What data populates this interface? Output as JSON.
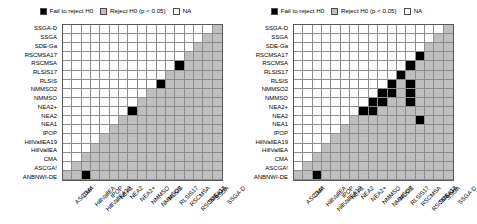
{
  "chart_data": {
    "type": "heatmap",
    "title": "",
    "xlabel": "",
    "ylabel": "",
    "legend_position": "top",
    "grid": true,
    "categories_x": [
      "ASCGA!",
      "CMA",
      "HillVallEA",
      "HillVallEA19",
      "IPOP",
      "NEA1",
      "NEA2",
      "NEA2+",
      "NMMSO",
      "NMMSO2",
      "RLSIS",
      "RLSIS17",
      "RSCMSA",
      "RSCMSA17",
      "SDE-Ga",
      "SSGA",
      "SSGA-D"
    ],
    "categories_y": [
      "SSGA-D",
      "SSGA",
      "SDE-Ga",
      "RSCMSA17",
      "RSCMSA",
      "RLSIS17",
      "RLSIS",
      "NMMSO2",
      "NMMSO",
      "NEA2+",
      "NEA2",
      "NEA1",
      "IPOP",
      "HillVallEA19",
      "HillVallEA",
      "CMA",
      "ASCGA!",
      "ANBNWI-DE"
    ],
    "value_legend": [
      {
        "key": "fail",
        "label": "Fail to reject H0",
        "color": "#000000"
      },
      {
        "key": "reject",
        "label": "Reject H0 (p < 0.05)",
        "color": "#bfbfbf"
      },
      {
        "key": "na",
        "label": "NA",
        "color": "#ffffff"
      }
    ],
    "panels": [
      {
        "name": "left-panel",
        "matrix": [
          [
            "na",
            "na",
            "na",
            "na",
            "na",
            "na",
            "na",
            "na",
            "na",
            "na",
            "na",
            "na",
            "na",
            "na",
            "na",
            "na",
            "reject"
          ],
          [
            "na",
            "na",
            "na",
            "na",
            "na",
            "na",
            "na",
            "na",
            "na",
            "na",
            "na",
            "na",
            "na",
            "na",
            "na",
            "reject",
            "reject"
          ],
          [
            "na",
            "na",
            "na",
            "na",
            "na",
            "na",
            "na",
            "na",
            "na",
            "na",
            "na",
            "na",
            "na",
            "na",
            "reject",
            "reject",
            "reject"
          ],
          [
            "na",
            "na",
            "na",
            "na",
            "na",
            "na",
            "na",
            "na",
            "na",
            "na",
            "na",
            "na",
            "na",
            "reject",
            "reject",
            "reject",
            "reject"
          ],
          [
            "na",
            "na",
            "na",
            "na",
            "na",
            "na",
            "na",
            "na",
            "na",
            "na",
            "na",
            "na",
            "fail",
            "reject",
            "reject",
            "reject",
            "reject"
          ],
          [
            "na",
            "na",
            "na",
            "na",
            "na",
            "na",
            "na",
            "na",
            "na",
            "na",
            "na",
            "reject",
            "reject",
            "reject",
            "reject",
            "reject",
            "reject"
          ],
          [
            "na",
            "na",
            "na",
            "na",
            "na",
            "na",
            "na",
            "na",
            "na",
            "na",
            "fail",
            "reject",
            "reject",
            "reject",
            "reject",
            "reject",
            "reject"
          ],
          [
            "na",
            "na",
            "na",
            "na",
            "na",
            "na",
            "na",
            "na",
            "na",
            "reject",
            "reject",
            "reject",
            "reject",
            "reject",
            "reject",
            "reject",
            "reject"
          ],
          [
            "na",
            "na",
            "na",
            "na",
            "na",
            "na",
            "na",
            "na",
            "reject",
            "reject",
            "reject",
            "reject",
            "reject",
            "reject",
            "reject",
            "reject",
            "reject"
          ],
          [
            "na",
            "na",
            "na",
            "na",
            "na",
            "na",
            "na",
            "fail",
            "reject",
            "reject",
            "reject",
            "reject",
            "reject",
            "reject",
            "reject",
            "reject",
            "reject"
          ],
          [
            "na",
            "na",
            "na",
            "na",
            "na",
            "na",
            "reject",
            "reject",
            "reject",
            "reject",
            "reject",
            "reject",
            "reject",
            "reject",
            "reject",
            "reject",
            "reject"
          ],
          [
            "na",
            "na",
            "na",
            "na",
            "na",
            "reject",
            "reject",
            "reject",
            "reject",
            "reject",
            "reject",
            "reject",
            "reject",
            "reject",
            "reject",
            "reject",
            "reject"
          ],
          [
            "na",
            "na",
            "na",
            "na",
            "reject",
            "reject",
            "reject",
            "reject",
            "reject",
            "reject",
            "reject",
            "reject",
            "reject",
            "reject",
            "reject",
            "reject",
            "reject"
          ],
          [
            "na",
            "na",
            "na",
            "reject",
            "reject",
            "reject",
            "reject",
            "reject",
            "reject",
            "reject",
            "reject",
            "reject",
            "reject",
            "reject",
            "reject",
            "reject",
            "reject"
          ],
          [
            "na",
            "na",
            "reject",
            "reject",
            "reject",
            "reject",
            "reject",
            "reject",
            "reject",
            "reject",
            "reject",
            "reject",
            "reject",
            "reject",
            "reject",
            "reject",
            "reject"
          ],
          [
            "na",
            "reject",
            "reject",
            "reject",
            "reject",
            "reject",
            "reject",
            "reject",
            "reject",
            "reject",
            "reject",
            "reject",
            "reject",
            "reject",
            "reject",
            "reject",
            "reject"
          ],
          [
            "reject",
            "reject",
            "fail",
            "reject",
            "reject",
            "reject",
            "reject",
            "reject",
            "reject",
            "reject",
            "reject",
            "reject",
            "reject",
            "reject",
            "reject",
            "reject",
            "reject"
          ],
          [
            "reject",
            "reject",
            "reject",
            "reject",
            "reject",
            "reject",
            "reject",
            "reject",
            "reject",
            "reject",
            "fail",
            "fail",
            "reject",
            "reject",
            "reject",
            "reject",
            "reject"
          ]
        ]
      },
      {
        "name": "right-panel",
        "matrix": [
          [
            "na",
            "na",
            "na",
            "na",
            "na",
            "na",
            "na",
            "na",
            "na",
            "na",
            "na",
            "na",
            "na",
            "na",
            "na",
            "na",
            "reject"
          ],
          [
            "na",
            "na",
            "na",
            "na",
            "na",
            "na",
            "na",
            "na",
            "na",
            "na",
            "na",
            "na",
            "na",
            "na",
            "na",
            "reject",
            "reject"
          ],
          [
            "na",
            "na",
            "na",
            "na",
            "na",
            "na",
            "na",
            "na",
            "na",
            "na",
            "na",
            "na",
            "na",
            "na",
            "reject",
            "reject",
            "reject"
          ],
          [
            "na",
            "na",
            "na",
            "na",
            "na",
            "na",
            "na",
            "na",
            "na",
            "na",
            "na",
            "na",
            "na",
            "fail",
            "reject",
            "reject",
            "reject"
          ],
          [
            "na",
            "na",
            "na",
            "na",
            "na",
            "na",
            "na",
            "na",
            "na",
            "na",
            "na",
            "na",
            "fail",
            "reject",
            "reject",
            "reject",
            "reject"
          ],
          [
            "na",
            "na",
            "na",
            "na",
            "na",
            "na",
            "na",
            "na",
            "na",
            "na",
            "na",
            "fail",
            "reject",
            "reject",
            "reject",
            "reject",
            "reject"
          ],
          [
            "na",
            "na",
            "na",
            "na",
            "na",
            "na",
            "na",
            "na",
            "na",
            "na",
            "fail",
            "reject",
            "fail",
            "reject",
            "reject",
            "reject",
            "reject"
          ],
          [
            "na",
            "na",
            "na",
            "na",
            "na",
            "na",
            "na",
            "na",
            "na",
            "fail",
            "fail",
            "reject",
            "fail",
            "reject",
            "reject",
            "reject",
            "reject"
          ],
          [
            "na",
            "na",
            "na",
            "na",
            "na",
            "na",
            "na",
            "na",
            "fail",
            "fail",
            "reject",
            "reject",
            "fail",
            "reject",
            "reject",
            "reject",
            "reject"
          ],
          [
            "na",
            "na",
            "na",
            "na",
            "na",
            "na",
            "na",
            "fail",
            "fail",
            "reject",
            "reject",
            "reject",
            "reject",
            "reject",
            "reject",
            "reject",
            "reject"
          ],
          [
            "na",
            "na",
            "na",
            "na",
            "na",
            "na",
            "reject",
            "reject",
            "reject",
            "reject",
            "reject",
            "reject",
            "reject",
            "fail",
            "reject",
            "reject",
            "reject"
          ],
          [
            "na",
            "na",
            "na",
            "na",
            "na",
            "reject",
            "reject",
            "reject",
            "reject",
            "reject",
            "reject",
            "reject",
            "reject",
            "reject",
            "reject",
            "reject",
            "reject"
          ],
          [
            "na",
            "na",
            "na",
            "na",
            "reject",
            "reject",
            "reject",
            "reject",
            "reject",
            "reject",
            "reject",
            "reject",
            "reject",
            "reject",
            "reject",
            "reject",
            "reject"
          ],
          [
            "na",
            "na",
            "na",
            "reject",
            "reject",
            "reject",
            "reject",
            "reject",
            "reject",
            "reject",
            "reject",
            "reject",
            "reject",
            "reject",
            "reject",
            "reject",
            "reject"
          ],
          [
            "na",
            "na",
            "reject",
            "reject",
            "reject",
            "reject",
            "reject",
            "reject",
            "reject",
            "reject",
            "reject",
            "reject",
            "reject",
            "reject",
            "reject",
            "reject",
            "reject"
          ],
          [
            "na",
            "reject",
            "reject",
            "reject",
            "reject",
            "reject",
            "reject",
            "reject",
            "reject",
            "reject",
            "reject",
            "reject",
            "reject",
            "reject",
            "reject",
            "reject",
            "reject"
          ],
          [
            "reject",
            "reject",
            "fail",
            "reject",
            "reject",
            "reject",
            "reject",
            "reject",
            "reject",
            "reject",
            "reject",
            "reject",
            "reject",
            "reject",
            "reject",
            "reject",
            "reject"
          ],
          [
            "reject",
            "reject",
            "reject",
            "reject",
            "reject",
            "reject",
            "reject",
            "reject",
            "reject",
            "reject",
            "fail",
            "fail",
            "reject",
            "reject",
            "reject",
            "reject",
            "reject"
          ]
        ]
      }
    ]
  }
}
